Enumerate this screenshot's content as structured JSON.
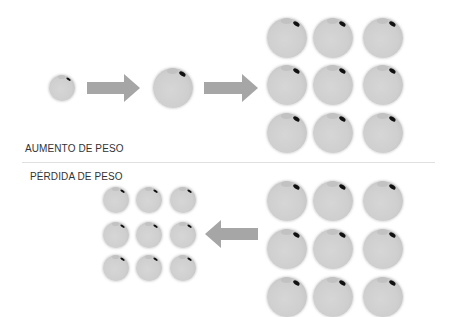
{
  "labels": {
    "gain": "AUMENTO DE PESO",
    "loss": "PÉRDIDA DE PESO"
  },
  "colors": {
    "cell": "#cfcfcf",
    "arrow": "#a6a6a6",
    "divider": "#e0e0e0",
    "text": "#333333"
  },
  "gain_section": {
    "small_cell": {
      "cx": 62,
      "cy": 88,
      "r": 13
    },
    "medium_cell": {
      "cx": 173,
      "cy": 88,
      "r": 20
    },
    "arrows": [
      {
        "x1": 87,
        "x2": 140,
        "cy": 88,
        "direction": "right"
      },
      {
        "x1": 204,
        "x2": 258,
        "cy": 88,
        "direction": "right"
      }
    ],
    "large_grid": {
      "cols": [
        287,
        333,
        383
      ],
      "rows": [
        38,
        85,
        133
      ],
      "r": 20
    }
  },
  "loss_section": {
    "large_grid": {
      "cols": [
        287,
        333,
        383
      ],
      "rows": [
        201,
        249,
        297
      ],
      "r": 20
    },
    "arrow": {
      "x1": 205,
      "x2": 258,
      "cy": 234,
      "direction": "left"
    },
    "small_grid": {
      "cols": [
        116,
        149,
        183
      ],
      "rows": [
        200,
        235,
        268
      ],
      "r": 13
    }
  }
}
